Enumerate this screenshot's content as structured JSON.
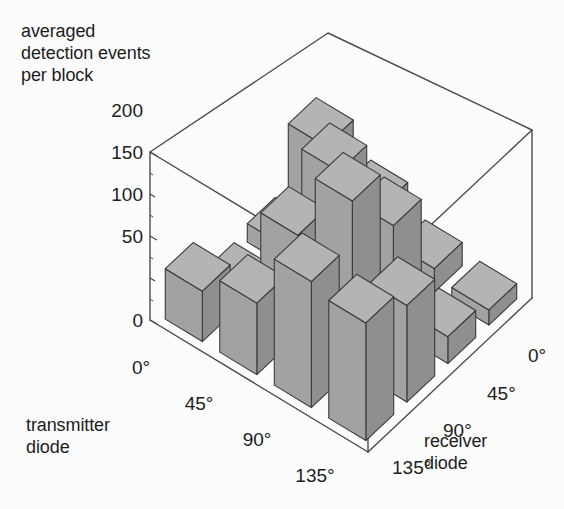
{
  "chart_data": {
    "type": "bar",
    "subtype": "3d-bar",
    "title": "averaged\ndetection events\nper block",
    "zlabel": "averaged detection events per block",
    "xlabel": "transmitter\ndiode",
    "ylabel": "receiver\ndiode",
    "x_categories": [
      "0°",
      "45°",
      "90°",
      "135°"
    ],
    "y_categories": [
      "0°",
      "45°",
      "90°",
      "135°"
    ],
    "zlim": [
      0,
      200
    ],
    "z_ticks": [
      "0",
      "50",
      "100",
      "150",
      "200"
    ],
    "z_tick_values": [
      0,
      50,
      100,
      150,
      200
    ],
    "grid": false,
    "legend": "none",
    "series": [
      {
        "name": "transmitter 0°",
        "values": [
          95,
          22,
          14,
          60
        ]
      },
      {
        "name": "transmitter 45°",
        "values": [
          60,
          150,
          120,
          85
        ]
      },
      {
        "name": "transmitter 90°",
        "values": [
          28,
          125,
          200,
          150
        ]
      },
      {
        "name": "transmitter 135°",
        "values": [
          18,
          32,
          115,
          140
        ]
      }
    ],
    "matrix_note": "rows = transmitter diode angle, columns = receiver diode angle",
    "values": [
      [
        95,
        22,
        14,
        60
      ],
      [
        60,
        150,
        120,
        85
      ],
      [
        28,
        125,
        200,
        150
      ],
      [
        18,
        32,
        115,
        140
      ]
    ]
  },
  "colors": {
    "bar_top": "#b4b4b4",
    "bar_left": "#8f8f8f",
    "bar_right": "#a2a2a2",
    "bar_outline": "#3a3a3a",
    "axis_line": "#4a4a4a",
    "text": "#1d1d1d",
    "background": "#fcfcfc"
  },
  "axis": {
    "z_title": "averaged\ndetection events\nper block",
    "x_title": "transmitter\ndiode",
    "y_title": "receiver\ndiode"
  }
}
